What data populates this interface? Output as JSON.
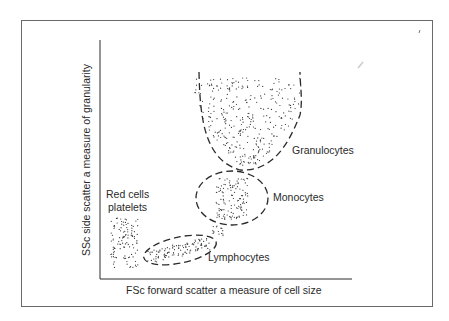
{
  "diagram": {
    "type": "flow-cytometry-scatter",
    "x_axis_label": "FSc  forward scatter a measure of cell size",
    "y_axis_label": "SSc  side scatter a measure of granularity",
    "populations": [
      {
        "name": "Granulocytes",
        "label": "Granulocytes"
      },
      {
        "name": "Monocytes",
        "label": "Monocytes"
      },
      {
        "name": "Lymphocytes",
        "label": "Lymphocytes"
      },
      {
        "name": "Red cells platelets",
        "label_line1": "Red cells",
        "label_line2": "platelets"
      }
    ],
    "colors": {
      "ink": "#2a2a2a",
      "frame": "#6a6a6a",
      "background": "#ffffff"
    }
  }
}
